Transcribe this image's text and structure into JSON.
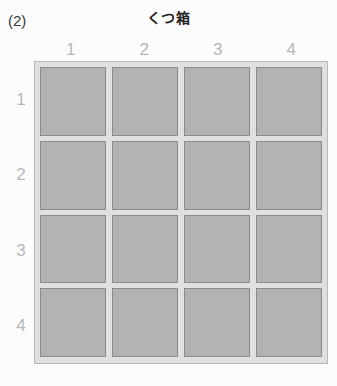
{
  "problem": {
    "number_label": "(2)"
  },
  "title": "くつ箱",
  "grid": {
    "column_headers": [
      "1",
      "2",
      "3",
      "4"
    ],
    "row_headers": [
      "1",
      "2",
      "3",
      "4"
    ],
    "rows": 4,
    "columns": 4,
    "total_cells": 16,
    "cells": [
      [
        {
          "content": ""
        },
        {
          "content": ""
        },
        {
          "content": ""
        },
        {
          "content": ""
        }
      ],
      [
        {
          "content": ""
        },
        {
          "content": ""
        },
        {
          "content": ""
        },
        {
          "content": ""
        }
      ],
      [
        {
          "content": ""
        },
        {
          "content": ""
        },
        {
          "content": ""
        },
        {
          "content": ""
        }
      ],
      [
        {
          "content": ""
        },
        {
          "content": ""
        },
        {
          "content": ""
        },
        {
          "content": ""
        }
      ]
    ]
  },
  "colors": {
    "page_background": "#ffffff",
    "frame_background": "#e2e2e2",
    "frame_border": "#b9b9b9",
    "cell_fill": "#b4b4b4",
    "cell_border": "#8d8d8d",
    "header_text": "#b8b8b8",
    "title_text": "#222222",
    "problem_number_text": "#3a3a3a"
  }
}
